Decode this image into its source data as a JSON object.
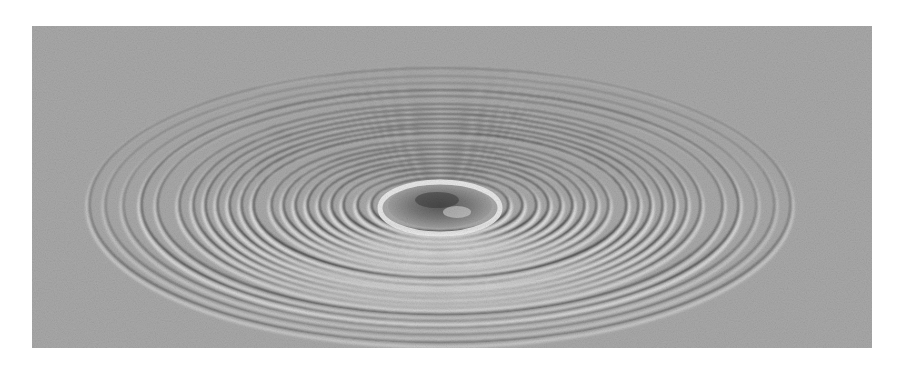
{
  "figure": {
    "alt": "Grayscale photograph of concentric circular ripples spreading outward on a water surface, viewed at an oblique angle",
    "colors": {
      "background": "#ffffff",
      "water": "#a9a9a9",
      "crest_light": "#f2f2f2",
      "trough_dark": "#1e1e1e",
      "center": "#6c6c6c"
    },
    "ripple_center": {
      "x": 408,
      "y": 180
    },
    "rings": [
      {
        "rx": 352,
        "ry": 138,
        "strength": 0.55
      },
      {
        "rx": 336,
        "ry": 130,
        "strength": 0.45
      },
      {
        "rx": 318,
        "ry": 123,
        "strength": 0.5
      },
      {
        "rx": 300,
        "ry": 116,
        "strength": 0.85
      },
      {
        "rx": 284,
        "ry": 110,
        "strength": 0.7
      },
      {
        "rx": 262,
        "ry": 102,
        "strength": 0.75
      },
      {
        "rx": 248,
        "ry": 97,
        "strength": 0.8
      },
      {
        "rx": 236,
        "ry": 92,
        "strength": 0.9
      },
      {
        "rx": 224,
        "ry": 87,
        "strength": 0.85
      },
      {
        "rx": 212,
        "ry": 82,
        "strength": 0.95
      },
      {
        "rx": 200,
        "ry": 78,
        "strength": 0.9
      },
      {
        "rx": 188,
        "ry": 73,
        "strength": 1.0
      },
      {
        "rx": 170,
        "ry": 66,
        "strength": 0.8
      },
      {
        "rx": 158,
        "ry": 61,
        "strength": 0.9
      },
      {
        "rx": 146,
        "ry": 57,
        "strength": 0.95
      },
      {
        "rx": 134,
        "ry": 52,
        "strength": 1.0
      },
      {
        "rx": 122,
        "ry": 47,
        "strength": 0.95
      },
      {
        "rx": 110,
        "ry": 43,
        "strength": 1.0
      },
      {
        "rx": 98,
        "ry": 38,
        "strength": 1.0
      },
      {
        "rx": 84,
        "ry": 33,
        "strength": 1.0
      },
      {
        "rx": 70,
        "ry": 28,
        "strength": 1.0
      }
    ]
  }
}
